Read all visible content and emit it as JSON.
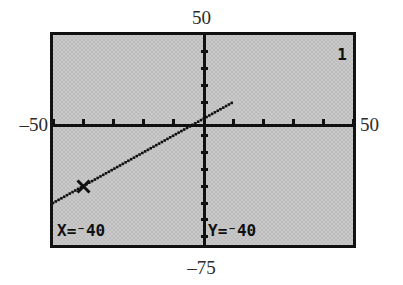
{
  "figure": {
    "kind": "graphing-calculator-screen"
  },
  "window": {
    "xmin_label": "–50",
    "xmax_label": "50",
    "ymax_label": "50",
    "ymin_label": "–75"
  },
  "screen": {
    "function_number": "1",
    "trace": {
      "x_readout": "X=⁻40",
      "y_readout": "Y=⁻40"
    }
  },
  "chart_data": {
    "type": "line",
    "title": "",
    "xlabel": "",
    "ylabel": "",
    "xlim": [
      -50,
      50
    ],
    "ylim": [
      -75,
      50
    ],
    "grid": false,
    "legend": "none",
    "axes": {
      "x_axis_at_y": 0,
      "y_axis_at_x": 0,
      "x_tick_spacing": 10,
      "y_tick_spacing": 10,
      "x_ticks": [
        -50,
        -40,
        -30,
        -20,
        -10,
        0,
        10,
        20,
        30,
        40,
        50
      ],
      "y_ticks": [
        -70,
        -60,
        -50,
        -40,
        -30,
        -20,
        -10,
        0,
        10,
        20,
        30,
        40
      ]
    },
    "series": [
      {
        "name": "Y1",
        "style": "dotted-pixel-line",
        "x": [
          -50,
          -40,
          -30,
          -20,
          -10,
          0,
          10
        ],
        "y": [
          -50,
          -40,
          -30,
          -20,
          -10,
          0,
          10
        ],
        "slope": 1,
        "intercept": 0
      }
    ],
    "annotations": [
      {
        "name": "trace-cursor",
        "label": "X=⁻40  Y=⁻40",
        "x": -40,
        "y": -40
      }
    ],
    "colors": {
      "screen_fill": "#c9c9c9",
      "ink": "#101010",
      "page_background": "#ffffff"
    }
  }
}
